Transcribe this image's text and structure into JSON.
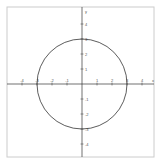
{
  "chart_data": {
    "type": "line",
    "title": "",
    "xlabel": "x",
    "ylabel": "y",
    "xlim": [
      -5,
      5
    ],
    "ylim": [
      -5,
      5
    ],
    "grid": false,
    "x_ticks": [
      -4,
      -3,
      -2,
      -1,
      1,
      2,
      3,
      4
    ],
    "y_ticks": [
      4,
      3,
      2,
      1,
      -1,
      -2,
      -3,
      -4
    ],
    "series": [
      {
        "name": "circle",
        "center": [
          0,
          0
        ],
        "radius": 3,
        "color": "#333333"
      }
    ]
  },
  "colors": {
    "axis": "#333333",
    "frame": "#cccccc",
    "curve": "#333333",
    "label": "#555555"
  }
}
